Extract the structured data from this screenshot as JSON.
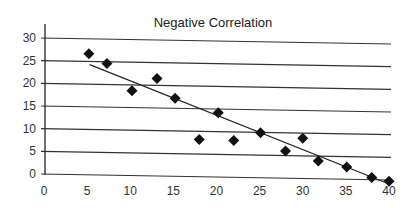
{
  "chart_data": {
    "type": "scatter",
    "title": "Negative Correlation",
    "xlabel": "",
    "ylabel": "",
    "xlim": [
      0,
      40
    ],
    "ylim": [
      0,
      30
    ],
    "x_ticks": [
      0,
      5,
      10,
      15,
      20,
      25,
      30,
      35,
      40
    ],
    "y_ticks": [
      0,
      5,
      10,
      15,
      20,
      25,
      30
    ],
    "grid": {
      "horizontal": true,
      "vertical": false
    },
    "legend": null,
    "marker": "diamond",
    "series": [
      {
        "name": "data",
        "points": [
          {
            "x": 5.2,
            "y": 26.7
          },
          {
            "x": 7.3,
            "y": 24.6
          },
          {
            "x": 10.2,
            "y": 18.7
          },
          {
            "x": 13.1,
            "y": 21.5
          },
          {
            "x": 15.2,
            "y": 17.2
          },
          {
            "x": 18.0,
            "y": 8.2
          },
          {
            "x": 20.2,
            "y": 14.2
          },
          {
            "x": 22.0,
            "y": 8.1
          },
          {
            "x": 25.1,
            "y": 9.9
          },
          {
            "x": 28.0,
            "y": 6.0
          },
          {
            "x": 30.0,
            "y": 8.9
          },
          {
            "x": 31.8,
            "y": 3.9
          },
          {
            "x": 35.1,
            "y": 2.7
          },
          {
            "x": 38.0,
            "y": 0.5
          },
          {
            "x": 40.0,
            "y": -0.3
          }
        ]
      }
    ],
    "trendline": {
      "type": "linear",
      "x_start": 5.3,
      "y_start": 24.3,
      "x_end": 39.5,
      "y_end": -0.5
    },
    "colors": {
      "marker": "#111111",
      "line": "#222222",
      "grid": "#333333",
      "text": "#333333"
    }
  }
}
